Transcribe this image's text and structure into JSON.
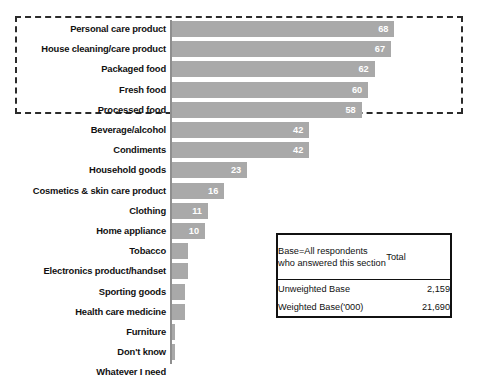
{
  "chart_data": {
    "type": "bar",
    "orientation": "horizontal",
    "title": "",
    "subtitle": "",
    "xlabel": "",
    "ylabel": "",
    "xlim": [
      0,
      70
    ],
    "grid": false,
    "legend": false,
    "value_label_color": "#ffffff",
    "bar_color": "#a9a9a9",
    "categories": [
      "Personal care product",
      "House cleaning/care product",
      "Packaged food",
      "Fresh food",
      "Processed food",
      "Beverage/alcohol",
      "Condiments",
      "Household goods",
      "Cosmetics & skin care product",
      "Clothing",
      "Home appliance",
      "Tobacco",
      "Electronics product/handset",
      "Sporting goods",
      "Health care medicine",
      "Furniture",
      "Don't know",
      "Whatever I need"
    ],
    "values": [
      68,
      67,
      62,
      60,
      58,
      42,
      42,
      23,
      16,
      11,
      10,
      5,
      5,
      4,
      4,
      1,
      1,
      0
    ],
    "value_labels": [
      "68",
      "67",
      "62",
      "60",
      "58",
      "42",
      "42",
      "23",
      "16",
      "11",
      "10",
      "5",
      "5",
      "4",
      "4",
      "",
      "",
      ""
    ],
    "highlight_group": {
      "style": "dashed-box",
      "color": "#2b2b2b",
      "categories": [
        "Personal care product",
        "House cleaning/care product",
        "Packaged food",
        "Fresh food",
        "Processed food"
      ]
    }
  },
  "base_table": {
    "header_left": "Base=All respondents who answered this section",
    "header_right": "Total",
    "rows": [
      {
        "label": "Unweighted Base",
        "value": "2,159"
      },
      {
        "label": "Weighted Base('000)",
        "value": "21,690"
      }
    ]
  }
}
